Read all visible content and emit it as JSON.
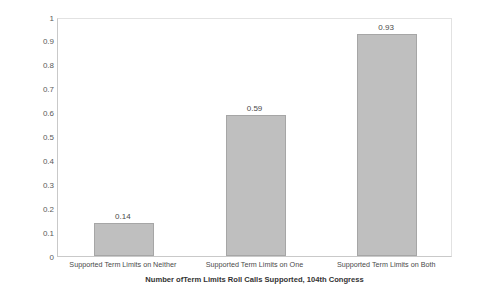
{
  "chart_data": {
    "type": "bar",
    "title": "",
    "categories": [
      "Supported Term Limits on Neither",
      "Supported Term Limits on One",
      "Supported Term Limits on Both"
    ],
    "values": [
      0.14,
      0.59,
      0.93
    ],
    "data_labels": [
      "0.14",
      "0.59",
      "0.93"
    ],
    "xlabel": "Number ofTerm Limits Roll Calls Supported, 104th Congress",
    "ylabel": "Probability of Seat Remaining Republican",
    "ylim": [
      0,
      1
    ],
    "ytick_labels": [
      "0",
      "0.1",
      "0.2",
      "0.3",
      "0.4",
      "0.5",
      "0.6",
      "0.7",
      "0.8",
      "0.9",
      "1"
    ],
    "ytick_values": [
      0,
      0.1,
      0.2,
      0.3,
      0.4,
      0.5,
      0.6,
      0.7,
      0.8,
      0.9,
      1
    ],
    "grid": false,
    "legend": null,
    "bar_fill_color": "#bfbfbf",
    "bar_border_color": "#a6a6a6",
    "plot_background_color": "#ffffff",
    "plot_border_color": "#c9c9c9"
  }
}
